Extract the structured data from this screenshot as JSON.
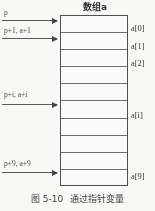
{
  "figure": {
    "array_title": "数组a",
    "caption_number": "图 5-10",
    "caption_text": "通过指针变量"
  },
  "array": {
    "cell_count": 10,
    "index_labels": [
      {
        "text": "a[0]",
        "cell": 0
      },
      {
        "text": "a[1]",
        "cell": 1
      },
      {
        "text": "a[2]",
        "cell": 2
      },
      {
        "text": "a[i]",
        "cell": 5
      },
      {
        "text": "a[9]",
        "cell": 9
      }
    ]
  },
  "pointers": [
    {
      "label": "p",
      "target_cell": 0
    },
    {
      "label": "p+1, a+1",
      "target_cell": 1
    },
    {
      "label": "p+i, a+i",
      "target_cell": 5
    },
    {
      "label": "p+9, a+9",
      "target_cell": 9
    }
  ],
  "colors": {
    "box_border": "#4a4a4a",
    "cell_divider": "#6e6e6e",
    "arrow": "#555555",
    "text": "#2e2e2e",
    "background": "#fdfdfc"
  }
}
